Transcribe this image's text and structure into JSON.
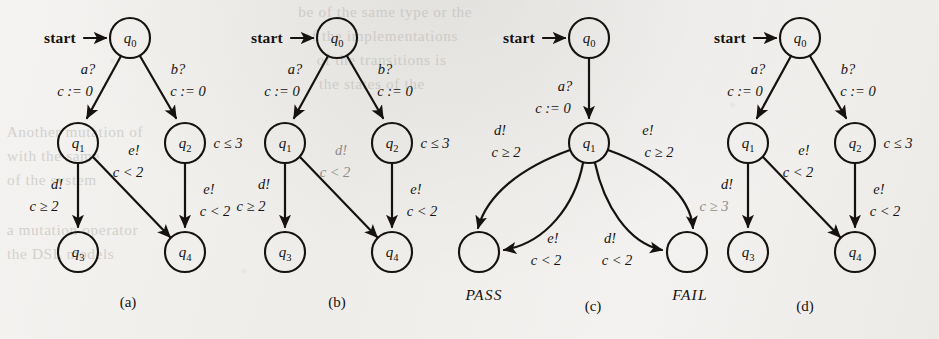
{
  "figure": {
    "caption_a": "(a)",
    "caption_b": "(b)",
    "caption_c": "(c)",
    "caption_d": "(d)",
    "ink_color": "#15120f",
    "gray_color": "#8e8b86",
    "paper_color": "#f2f1ef"
  },
  "labels": {
    "start": "start",
    "q0": "q",
    "q0s": "0",
    "q1": "q",
    "q1s": "1",
    "q2": "q",
    "q2s": "2",
    "q3": "q",
    "q3s": "3",
    "q4": "q",
    "q4s": "4",
    "pass": "PASS",
    "fail": "FAIL"
  },
  "panel_a": {
    "name": "(a)",
    "e_a_action": "a?",
    "e_a_update": "c := 0",
    "e_b_action": "b?",
    "e_b_update": "c := 0",
    "inv_q2": "c ≤ 3",
    "e_d_action": "d!",
    "e_d_guard": "c ≥ 2",
    "e_diag_action": "e!",
    "e_diag_guard": "c < 2",
    "e_right_action": "e!",
    "e_right_guard": "c < 2"
  },
  "panel_b": {
    "name": "(b)",
    "e_a_action": "a?",
    "e_a_update": "c := 0",
    "e_b_action": "b?",
    "e_b_update": "c := 0",
    "inv_q2": "c ≤ 3",
    "e_d_action": "d!",
    "e_d_guard": "c ≥ 2",
    "e_diag_action": "d!",
    "e_diag_guard": "c < 2",
    "e_diag_mutated": true,
    "e_right_action": "e!",
    "e_right_guard": "c < 2"
  },
  "panel_c": {
    "name": "(c)",
    "e_a_action": "a?",
    "e_a_update": "c := 0",
    "e_pass_outer_action": "d!",
    "e_pass_outer_guard": "c ≥ 2",
    "e_fail_outer_action": "e!",
    "e_fail_outer_guard": "c ≥ 2",
    "e_pass_inner_action": "e!",
    "e_pass_inner_guard": "c < 2",
    "e_fail_inner_action": "d!",
    "e_fail_inner_guard": "c < 2"
  },
  "panel_d": {
    "name": "(d)",
    "e_a_action": "a?",
    "e_a_update": "c := 0",
    "e_b_action": "b?",
    "e_b_update": "c := 0",
    "inv_q2": "c ≤ 3",
    "e_d_action": "d!",
    "e_d_guard": "c ≥ 3",
    "e_d_mutated": true,
    "e_diag_action": "e!",
    "e_diag_guard": "c < 2",
    "e_right_action": "e!",
    "e_right_guard": "c < 2"
  },
  "bleed": {
    "l1": "be of the same type or the",
    "l2": "of the implementations",
    "l3": "of the transitions is",
    "l4": "the states of the",
    "l5": "Another mutation of",
    "l6": "with the same",
    "l7": "of the system",
    "l8": "a mutation operator",
    "l9": "the DSL models"
  }
}
